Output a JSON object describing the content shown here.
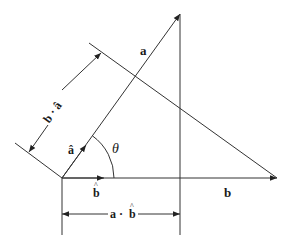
{
  "diagram": {
    "labels": {
      "a": "a",
      "b": "b",
      "a_hat": "â",
      "b_hat": "b",
      "b_hat_caret": "^",
      "theta": "θ",
      "b_dot_a_hat": "b · â",
      "a_dot_b_hat_a": "a ·",
      "a_dot_b_hat_b": "b",
      "a_dot_b_hat_caret": "^"
    },
    "colors": {
      "line": "#333333",
      "background": "#ffffff"
    },
    "points": {
      "origin": [
        62,
        178
      ],
      "a_tip": [
        180,
        14
      ],
      "b_tip": [
        277,
        178
      ]
    }
  }
}
